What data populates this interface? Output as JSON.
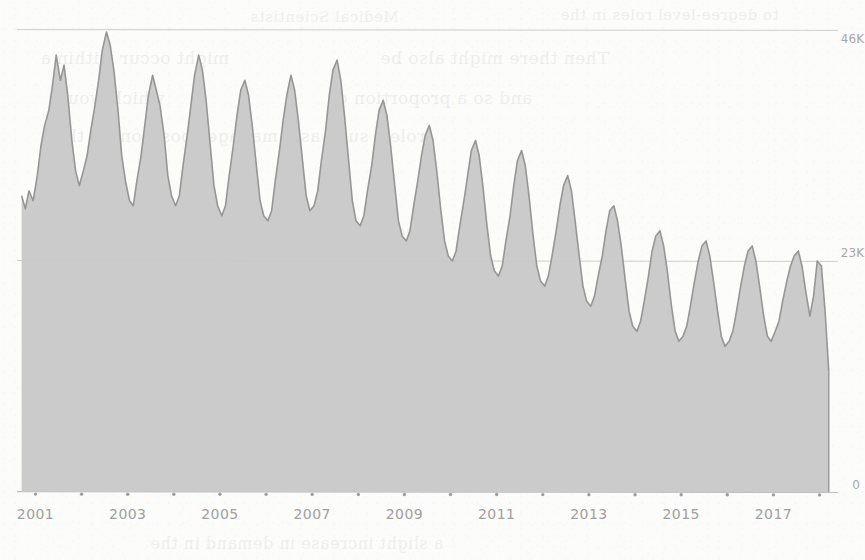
{
  "background_show_through": {
    "note": "faint mirrored text bleeding through from reverse of scanned page",
    "lines": [
      {
        "text": "Medical Scientists",
        "top": 8,
        "left": 250,
        "size": 15
      },
      {
        "text": "to degree-level roles in the",
        "top": 6,
        "left": 560,
        "size": 15
      },
      {
        "text": "might occur within a",
        "top": 48,
        "left": 40,
        "size": 17
      },
      {
        "text": "Then there might also be",
        "top": 48,
        "left": 380,
        "size": 17
      },
      {
        "text": "which would",
        "top": 88,
        "left": 50,
        "size": 17
      },
      {
        "text": "and so a proportion of",
        "top": 88,
        "left": 330,
        "size": 17
      },
      {
        "text": "roles, such as a manager position, in the",
        "top": 126,
        "left": 55,
        "size": 17
      },
      {
        "text": "Medical Scientist roles had been",
        "top": 222,
        "left": 150,
        "size": 16
      },
      {
        "text": "a reduction in the number of",
        "top": 262,
        "left": 120,
        "size": 16
      },
      {
        "text": "and the increase may be attributed to",
        "top": 300,
        "left": 170,
        "size": 16
      },
      {
        "text": "employment levels in the",
        "top": 338,
        "left": 300,
        "size": 16
      },
      {
        "text": "a slight increase in demand in the",
        "top": 534,
        "left": 150,
        "size": 16
      }
    ]
  },
  "chart_data": {
    "type": "area",
    "title": "",
    "subtitle": "",
    "xlabel": "",
    "ylabel": "",
    "grid": true,
    "legend_position": "none",
    "axis_label_side": "right",
    "ylim": [
      0,
      46000
    ],
    "yticks": [
      0,
      23000,
      46000
    ],
    "ytick_labels": [
      "0",
      "23K",
      "46K"
    ],
    "xlim": [
      2000.6,
      2018.4
    ],
    "xticks": [
      2001,
      2003,
      2005,
      2007,
      2009,
      2011,
      2013,
      2015,
      2017
    ],
    "xtick_labels": [
      "2001",
      "2003",
      "2005",
      "2007",
      "2009",
      "2011",
      "2013",
      "2015",
      "2017"
    ],
    "minor_xticks": [
      2002,
      2004,
      2006,
      2008,
      2010,
      2012,
      2014,
      2016,
      2018
    ],
    "colors": {
      "fill": "#c8c8c8",
      "stroke": "#969696",
      "gridline": "#b4b4b4",
      "axis_text": "#a0a0a0",
      "background": "#fcfcfb"
    },
    "series": [
      {
        "name": "Medical Scientists",
        "x": [
          2000.7,
          2000.78,
          2000.86,
          2000.95,
          2001.04,
          2001.12,
          2001.2,
          2001.29,
          2001.37,
          2001.45,
          2001.54,
          2001.62,
          2001.7,
          2001.79,
          2001.87,
          2001.95,
          2002.04,
          2002.12,
          2002.2,
          2002.29,
          2002.37,
          2002.45,
          2002.54,
          2002.62,
          2002.7,
          2002.79,
          2002.87,
          2002.95,
          2003.04,
          2003.12,
          2003.2,
          2003.29,
          2003.37,
          2003.45,
          2003.54,
          2003.62,
          2003.7,
          2003.79,
          2003.87,
          2003.95,
          2004.04,
          2004.12,
          2004.2,
          2004.29,
          2004.37,
          2004.45,
          2004.54,
          2004.62,
          2004.7,
          2004.79,
          2004.87,
          2004.95,
          2005.04,
          2005.12,
          2005.2,
          2005.29,
          2005.37,
          2005.45,
          2005.54,
          2005.62,
          2005.7,
          2005.79,
          2005.87,
          2005.95,
          2006.04,
          2006.12,
          2006.2,
          2006.29,
          2006.37,
          2006.45,
          2006.54,
          2006.62,
          2006.7,
          2006.79,
          2006.87,
          2006.95,
          2007.04,
          2007.12,
          2007.2,
          2007.29,
          2007.37,
          2007.45,
          2007.54,
          2007.62,
          2007.7,
          2007.79,
          2007.87,
          2007.95,
          2008.04,
          2008.12,
          2008.2,
          2008.29,
          2008.37,
          2008.45,
          2008.54,
          2008.62,
          2008.7,
          2008.79,
          2008.87,
          2008.95,
          2009.04,
          2009.12,
          2009.2,
          2009.29,
          2009.37,
          2009.45,
          2009.54,
          2009.62,
          2009.7,
          2009.79,
          2009.87,
          2009.95,
          2010.04,
          2010.12,
          2010.2,
          2010.29,
          2010.37,
          2010.45,
          2010.54,
          2010.62,
          2010.7,
          2010.79,
          2010.87,
          2010.95,
          2011.04,
          2011.12,
          2011.2,
          2011.29,
          2011.37,
          2011.45,
          2011.54,
          2011.62,
          2011.7,
          2011.79,
          2011.87,
          2011.95,
          2012.04,
          2012.12,
          2012.2,
          2012.29,
          2012.37,
          2012.45,
          2012.54,
          2012.62,
          2012.7,
          2012.79,
          2012.87,
          2012.95,
          2013.04,
          2013.12,
          2013.2,
          2013.29,
          2013.37,
          2013.45,
          2013.54,
          2013.62,
          2013.7,
          2013.79,
          2013.87,
          2013.95,
          2014.04,
          2014.12,
          2014.2,
          2014.29,
          2014.37,
          2014.45,
          2014.54,
          2014.62,
          2014.7,
          2014.79,
          2014.87,
          2014.95,
          2015.04,
          2015.12,
          2015.2,
          2015.29,
          2015.37,
          2015.45,
          2015.54,
          2015.62,
          2015.7,
          2015.79,
          2015.87,
          2015.95,
          2016.04,
          2016.12,
          2016.2,
          2016.29,
          2016.37,
          2016.45,
          2016.54,
          2016.62,
          2016.7,
          2016.79,
          2016.87,
          2016.95,
          2017.04,
          2017.12,
          2017.2,
          2017.29,
          2017.37,
          2017.45,
          2017.54,
          2017.62,
          2017.7,
          2017.79,
          2017.87,
          2017.95,
          2018.04,
          2018.12,
          2018.2
        ],
        "values": [
          29500,
          28200,
          30000,
          29000,
          31500,
          34500,
          36500,
          38000,
          40500,
          43500,
          41000,
          42500,
          39500,
          35000,
          32000,
          30500,
          32000,
          33500,
          36000,
          38500,
          41000,
          44000,
          45800,
          44500,
          42000,
          38000,
          33500,
          31000,
          29000,
          28500,
          31000,
          33500,
          36500,
          39500,
          41500,
          40000,
          38500,
          35500,
          31500,
          29500,
          28500,
          29500,
          32500,
          35500,
          38500,
          41500,
          43500,
          42000,
          39000,
          34500,
          30500,
          28500,
          27500,
          28500,
          31500,
          34500,
          37500,
          40000,
          41000,
          39500,
          36500,
          32500,
          29000,
          27500,
          27000,
          28000,
          31000,
          34000,
          37000,
          39500,
          41500,
          40000,
          37000,
          33000,
          29500,
          28000,
          28500,
          30000,
          33000,
          36000,
          39500,
          42000,
          43000,
          41000,
          37500,
          33000,
          29000,
          27000,
          26500,
          27500,
          30000,
          32500,
          35500,
          38000,
          39000,
          37500,
          34500,
          30500,
          27000,
          25500,
          25000,
          26000,
          28500,
          31000,
          33500,
          35500,
          36500,
          35000,
          32000,
          28000,
          25000,
          23500,
          23000,
          24000,
          26500,
          29000,
          31500,
          34000,
          35000,
          33500,
          30500,
          26500,
          23500,
          22000,
          21500,
          22500,
          25000,
          27500,
          30500,
          33000,
          34000,
          32500,
          29500,
          25500,
          22500,
          21000,
          20500,
          21500,
          23500,
          26000,
          28500,
          30500,
          31500,
          30000,
          27000,
          23500,
          20500,
          19000,
          18500,
          19500,
          21500,
          23500,
          26000,
          28000,
          28500,
          27000,
          24500,
          21000,
          18000,
          16500,
          16000,
          17000,
          19000,
          21500,
          24000,
          25500,
          26000,
          24500,
          22000,
          18500,
          16000,
          15000,
          15500,
          16500,
          18500,
          21000,
          23000,
          24500,
          25000,
          23500,
          21000,
          18000,
          15500,
          14500,
          15000,
          16000,
          18000,
          20500,
          22500,
          24000,
          24500,
          23000,
          20500,
          17500,
          15500,
          15000,
          16000,
          17000,
          19000,
          21000,
          22500,
          23500,
          24000,
          22500,
          20000,
          17500,
          19500,
          23000,
          22500,
          18000,
          12000
        ]
      }
    ]
  }
}
